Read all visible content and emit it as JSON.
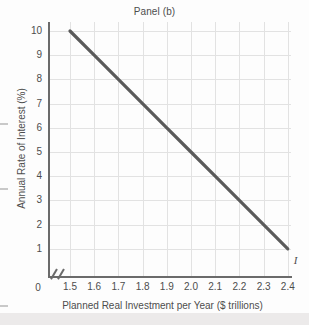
{
  "figure": {
    "title": "Panel (b)",
    "background_color": "#fdfdfd",
    "line_color": "#5a5a5a",
    "grid_color": "#e2e2e2",
    "axis_color": "#6b6b6b"
  },
  "chart_data": {
    "type": "line",
    "title": "Panel (b)",
    "xlabel": "Planned Real Investment per Year ($ trillions)",
    "ylabel": "Annual Rate of Interest (%)",
    "origin_label": "0",
    "axis_break": true,
    "grid": true,
    "legend": "none",
    "xlim": [
      1.4,
      2.5
    ],
    "ylim": [
      0,
      10
    ],
    "xticks": [
      "1.5",
      "1.6",
      "1.7",
      "1.8",
      "1.9",
      "2.0",
      "2.1",
      "2.2",
      "2.3",
      "2.4"
    ],
    "xtick_values": [
      1.5,
      1.6,
      1.7,
      1.8,
      1.9,
      2.0,
      2.1,
      2.2,
      2.3,
      2.4
    ],
    "yticks": [
      "10",
      "9",
      "8",
      "7",
      "6",
      "5",
      "4",
      "3",
      "2",
      "1"
    ],
    "ytick_values": [
      10,
      9,
      8,
      7,
      6,
      5,
      4,
      3,
      2,
      1
    ],
    "series": [
      {
        "name": "I",
        "annotation": "I",
        "x": [
          1.5,
          2.4
        ],
        "y": [
          10,
          1
        ],
        "points": [
          {
            "x": 1.5,
            "y": 10
          },
          {
            "x": 1.6,
            "y": 9
          },
          {
            "x": 1.7,
            "y": 8
          },
          {
            "x": 1.8,
            "y": 7
          },
          {
            "x": 1.9,
            "y": 6
          },
          {
            "x": 2.0,
            "y": 5
          },
          {
            "x": 2.1,
            "y": 4
          },
          {
            "x": 2.2,
            "y": 3
          },
          {
            "x": 2.3,
            "y": 2
          },
          {
            "x": 2.4,
            "y": 1
          }
        ]
      }
    ]
  }
}
